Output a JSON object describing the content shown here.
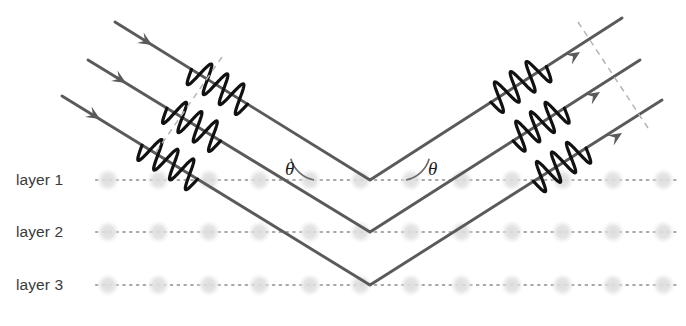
{
  "figure": {
    "background_color": "#ffffff"
  },
  "colors": {
    "ray": "#5a5a5a",
    "wave": "#111111",
    "atom": "#d8d8d8",
    "layer_line": "#a8a8a8",
    "wavefront_dash": "#b5b5b5",
    "label_text": "#3a3a3a",
    "theta_text": "#1c1c1c",
    "arc": "#6a6a6a"
  },
  "layers": [
    {
      "label": "layer 1",
      "y": 180,
      "label_x": 16,
      "label_y": 171
    },
    {
      "label": "layer 2",
      "y": 232,
      "label_x": 16,
      "label_y": 223
    },
    {
      "label": "layer 3",
      "y": 285,
      "label_x": 16,
      "label_y": 276
    }
  ],
  "atoms": {
    "radius": 11,
    "start_x": 108,
    "spacing": 50.5,
    "count": 12
  },
  "angles": [
    {
      "symbol": "θ",
      "x": 285,
      "y": 158,
      "arc_cx": 312,
      "arc_cy": 180,
      "side": "left"
    },
    {
      "symbol": "θ",
      "x": 428,
      "y": 158,
      "arc_cx": 408,
      "arc_cy": 180,
      "side": "right"
    }
  ],
  "rays": [
    {
      "name": "ray-1",
      "incoming_start": [
        115,
        22
      ],
      "vertex": [
        370,
        180
      ],
      "outgoing_end": [
        622,
        18
      ],
      "arrow_in": [
        152,
        45
      ],
      "arrow_out": [
        580,
        52
      ],
      "wave_start_t": 0.3,
      "wave_end_t": 0.52
    },
    {
      "name": "ray-2",
      "incoming_start": [
        88,
        60
      ],
      "vertex": [
        370,
        232
      ],
      "outgoing_end": [
        640,
        60
      ],
      "arrow_in": [
        126,
        83
      ],
      "arrow_out": [
        600,
        92
      ],
      "wave_start_t": 0.28,
      "wave_end_t": 0.47
    },
    {
      "name": "ray-3",
      "incoming_start": [
        62,
        96
      ],
      "vertex": [
        370,
        285
      ],
      "outgoing_end": [
        662,
        100
      ],
      "arrow_in": [
        100,
        119
      ],
      "arrow_out": [
        622,
        133
      ],
      "wave_start_t": 0.26,
      "wave_end_t": 0.44
    }
  ],
  "wavefronts": [
    {
      "name": "incoming-wavefront",
      "x1": 222,
      "y1": 57,
      "x2": 156,
      "y2": 152
    },
    {
      "name": "outgoing-wavefront",
      "x1": 578,
      "y1": 22,
      "x2": 648,
      "y2": 128
    }
  ]
}
